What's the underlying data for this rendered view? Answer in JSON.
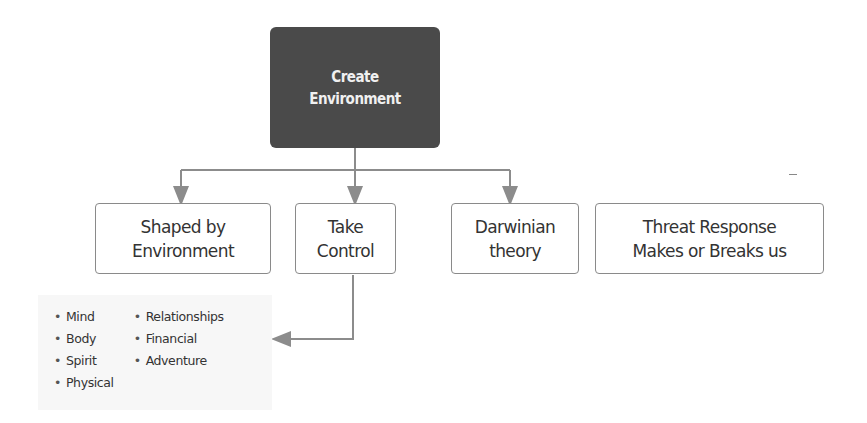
{
  "root": {
    "line1": "Create",
    "line2": "Environment"
  },
  "nodes": [
    {
      "line1": "Shaped by",
      "line2": "Environment"
    },
    {
      "line1": "Take",
      "line2": "Control"
    },
    {
      "line1": "Darwinian",
      "line2": "theory"
    },
    {
      "line1": "Threat Response",
      "line2": "Makes or Breaks us"
    }
  ],
  "list": {
    "col1": [
      "Mind",
      "Body",
      "Spirit",
      "Physical"
    ],
    "col2": [
      "Relationships",
      "Financial",
      "Adventure"
    ]
  },
  "colors": {
    "root_fill": "#4a4a4a",
    "connector": "#8c8c8c",
    "node_border": "#8a8a8a",
    "panel_fill": "#f7f7f7"
  }
}
